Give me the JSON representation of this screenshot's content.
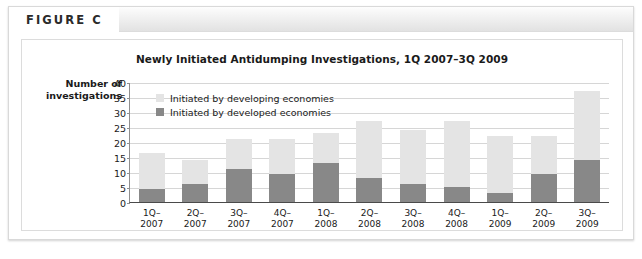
{
  "figure": {
    "label": "FIGURE C"
  },
  "chart_data": {
    "type": "bar",
    "subtype": "stacked-vertical",
    "title": "Newly Initiated Antidumping Investigations, 1Q 2007–3Q 2009",
    "xlabel": "",
    "ylabel": "Number of investigations",
    "ylim": [
      0,
      40
    ],
    "yticks": [
      0,
      5,
      10,
      15,
      20,
      25,
      30,
      35,
      40
    ],
    "grid": true,
    "legend_position": "top-left-inside",
    "categories": [
      "1Q–2007",
      "2Q–2007",
      "3Q–2007",
      "4Q–2007",
      "1Q–2008",
      "2Q–2008",
      "3Q–2008",
      "4Q–2008",
      "1Q–2009",
      "2Q–2009",
      "3Q–2009"
    ],
    "category_lines": [
      [
        "1Q–",
        "2007"
      ],
      [
        "2Q–",
        "2007"
      ],
      [
        "3Q–",
        "2007"
      ],
      [
        "4Q–",
        "2007"
      ],
      [
        "1Q–",
        "2008"
      ],
      [
        "2Q–",
        "2008"
      ],
      [
        "3Q–",
        "2008"
      ],
      [
        "4Q–",
        "2008"
      ],
      [
        "1Q–",
        "2009"
      ],
      [
        "2Q–",
        "2009"
      ],
      [
        "3Q–",
        "2009"
      ]
    ],
    "series": [
      {
        "name": "Initiated by developed economies",
        "color": "#888888",
        "values": [
          4.5,
          6,
          11,
          9.5,
          13,
          8,
          6,
          5,
          3,
          9.5,
          14
        ]
      },
      {
        "name": "Initiated by developing economies",
        "color": "#e4e4e4",
        "values": [
          12,
          8,
          10,
          11.5,
          10,
          19,
          18,
          22,
          19,
          12.5,
          23
        ]
      }
    ],
    "totals": [
      16.5,
      14,
      21,
      21,
      23,
      27,
      24,
      27,
      22,
      22,
      37
    ],
    "legend": [
      {
        "label": "Initiated by developing economies",
        "swatch": "developing"
      },
      {
        "label": "Initiated by developed economies",
        "swatch": "developed"
      }
    ]
  }
}
